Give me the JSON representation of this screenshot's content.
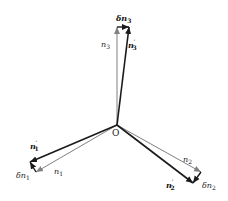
{
  "diagram": {
    "origin_label": "O",
    "colors": {
      "original_vector": "#808080",
      "perturbed_vector": "#1a1a1a",
      "delta_vector": "#1a1a1a",
      "background": "#ffffff"
    },
    "vectors": [
      {
        "id": "n1",
        "label": "n",
        "subscript": "1",
        "prime": "",
        "kind": "original"
      },
      {
        "id": "n2",
        "label": "n",
        "subscript": "2",
        "prime": "",
        "kind": "original"
      },
      {
        "id": "n3",
        "label": "n",
        "subscript": "3",
        "prime": "",
        "kind": "original"
      },
      {
        "id": "n1p",
        "label": "n",
        "subscript": "1",
        "prime": "′",
        "kind": "perturbed"
      },
      {
        "id": "n2p",
        "label": "n",
        "subscript": "2",
        "prime": "′",
        "kind": "perturbed"
      },
      {
        "id": "n3p",
        "label": "n",
        "subscript": "3",
        "prime": "′",
        "kind": "perturbed"
      },
      {
        "id": "dn1",
        "label": "δn",
        "subscript": "1",
        "prime": "",
        "kind": "delta"
      },
      {
        "id": "dn2",
        "label": "δn",
        "subscript": "2",
        "prime": "",
        "kind": "delta"
      },
      {
        "id": "dn3",
        "label": "δn",
        "subscript": "3",
        "prime": "",
        "kind": "delta"
      }
    ]
  }
}
